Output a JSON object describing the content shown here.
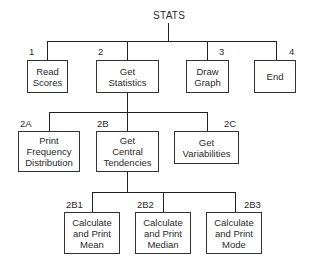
{
  "diagram": {
    "type": "hierarchy-chart",
    "root": {
      "label": "STATS"
    },
    "level1": [
      {
        "id": "1",
        "label": "Read\nScores"
      },
      {
        "id": "2",
        "label": "Get\nStatistics"
      },
      {
        "id": "3",
        "label": "Draw\nGraph"
      },
      {
        "id": "4",
        "label": "End"
      }
    ],
    "level2": [
      {
        "id": "2A",
        "label": "Print\nFrequency\nDistribution",
        "parent": "2"
      },
      {
        "id": "2B",
        "label": "Get\nCentral\nTendencies",
        "parent": "2"
      },
      {
        "id": "2C",
        "label": "Get\nVariabilities",
        "parent": "2"
      }
    ],
    "level3": [
      {
        "id": "2B1",
        "label": "Calculate\nand Print\nMean",
        "parent": "2B"
      },
      {
        "id": "2B2",
        "label": "Calculate\nand Print\nMedian",
        "parent": "2B"
      },
      {
        "id": "2B3",
        "label": "Calculate\nand Print\nMode",
        "parent": "2B"
      }
    ]
  }
}
